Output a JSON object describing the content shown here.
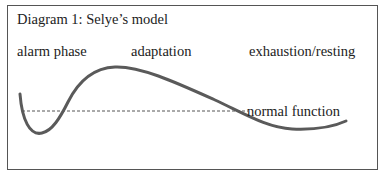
{
  "diagram": {
    "title": "Diagram 1: Selye’s model",
    "phases": [
      {
        "label": "alarm phase"
      },
      {
        "label": "adaptation"
      },
      {
        "label": "exhaustion/resting"
      }
    ],
    "baseline_label": "normal function",
    "colors": {
      "curve": "#5a5a5a",
      "baseline": "#555555",
      "border": "#555555",
      "text": "#222222"
    }
  }
}
